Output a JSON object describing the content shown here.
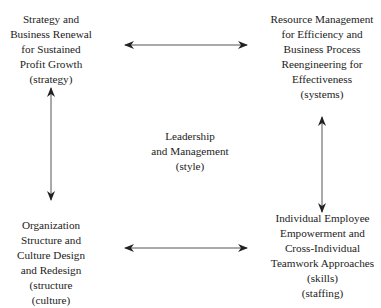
{
  "diagram": {
    "nodes": {
      "top_left": {
        "lines": [
          "Strategy and",
          "Business Renewal",
          "for Sustained",
          "Profit Growth",
          "(strategy)"
        ]
      },
      "top_right": {
        "lines": [
          "Resource Management",
          "for Efficiency and",
          "Business Process",
          "Reengineering for",
          "Effectiveness",
          "(systems)"
        ]
      },
      "center": {
        "lines": [
          "Leadership",
          "and Management",
          "(style)"
        ]
      },
      "bottom_left": {
        "lines": [
          "Organization",
          "Structure and",
          "Culture Design",
          "and Redesign",
          "(structure",
          "(culture)"
        ]
      },
      "bottom_right": {
        "lines": [
          "Individual Employee",
          "Empowerment and",
          "Cross-Individual",
          "Teamwork Approaches",
          "(skills)",
          "(staffing)"
        ]
      }
    },
    "edges": [
      {
        "from": "top_left",
        "to": "top_right",
        "type": "bidirectional"
      },
      {
        "from": "top_left",
        "to": "bottom_left",
        "type": "bidirectional"
      },
      {
        "from": "top_right",
        "to": "bottom_right",
        "type": "bidirectional"
      },
      {
        "from": "bottom_left",
        "to": "bottom_right",
        "type": "bidirectional"
      }
    ],
    "colors": {
      "text": "#222222",
      "arrow": "#333333",
      "background": "#ffffff"
    }
  }
}
